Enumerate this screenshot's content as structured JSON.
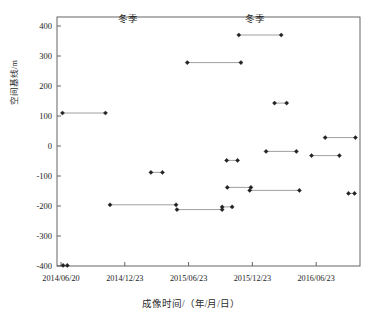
{
  "chart_data": {
    "type": "line",
    "title": "",
    "xlabel": "成像时间/（年/月/日）",
    "ylabel": "空间基线/m",
    "ylim": [
      -400,
      430
    ],
    "yticks": [
      400,
      300,
      200,
      100,
      0,
      -100,
      -200,
      -300,
      -400
    ],
    "ytick_labels": [
      "400",
      "300",
      "200",
      "100",
      "0",
      "-100",
      "-200",
      "-300",
      "-400"
    ],
    "xticks": [
      "2014/06/20",
      "2014/12/23",
      "2015/06/23",
      "2015/12/23",
      "2016/06/23"
    ],
    "xtick_labels": [
      "2014/06/20",
      "2014/12/23",
      "2015/06/23",
      "2015/12/23",
      "2016/06/23"
    ],
    "grid": false,
    "legend": null,
    "annotations": [
      {
        "text": "冬季",
        "x_frac": 0.235,
        "y_value": 412
      },
      {
        "text": "冬季",
        "x_frac": 0.655,
        "y_value": 412
      }
    ],
    "marker": "filled-diamond",
    "series": [
      {
        "name": "baseline-pair-1",
        "points": [
          {
            "x_frac": 0.018,
            "y": 110
          },
          {
            "x_frac": 0.16,
            "y": 110
          }
        ]
      },
      {
        "name": "baseline-pair-2",
        "points": [
          {
            "x_frac": 0.02,
            "y": -398
          },
          {
            "x_frac": 0.034,
            "y": -398
          }
        ]
      },
      {
        "name": "baseline-pair-3",
        "points": [
          {
            "x_frac": 0.175,
            "y": -196
          },
          {
            "x_frac": 0.393,
            "y": -196
          }
        ]
      },
      {
        "name": "baseline-pair-4",
        "points": [
          {
            "x_frac": 0.31,
            "y": -88
          },
          {
            "x_frac": 0.348,
            "y": -88
          }
        ]
      },
      {
        "name": "baseline-pair-5",
        "points": [
          {
            "x_frac": 0.396,
            "y": -212
          },
          {
            "x_frac": 0.545,
            "y": -212
          }
        ]
      },
      {
        "name": "baseline-pair-6",
        "points": [
          {
            "x_frac": 0.545,
            "y": -203
          },
          {
            "x_frac": 0.578,
            "y": -203
          }
        ]
      },
      {
        "name": "baseline-pair-7",
        "points": [
          {
            "x_frac": 0.43,
            "y": 278
          },
          {
            "x_frac": 0.607,
            "y": 278
          }
        ]
      },
      {
        "name": "baseline-pair-8",
        "points": [
          {
            "x_frac": 0.6,
            "y": 370
          },
          {
            "x_frac": 0.74,
            "y": 370
          }
        ]
      },
      {
        "name": "baseline-pair-9",
        "points": [
          {
            "x_frac": 0.56,
            "y": -48
          },
          {
            "x_frac": 0.596,
            "y": -48
          }
        ]
      },
      {
        "name": "baseline-pair-10",
        "points": [
          {
            "x_frac": 0.562,
            "y": -138
          },
          {
            "x_frac": 0.64,
            "y": -138
          }
        ]
      },
      {
        "name": "baseline-pair-11",
        "points": [
          {
            "x_frac": 0.636,
            "y": -148
          },
          {
            "x_frac": 0.8,
            "y": -148
          }
        ]
      },
      {
        "name": "baseline-pair-12",
        "points": [
          {
            "x_frac": 0.69,
            "y": -18
          },
          {
            "x_frac": 0.79,
            "y": -18
          }
        ]
      },
      {
        "name": "baseline-pair-13",
        "points": [
          {
            "x_frac": 0.718,
            "y": 143
          },
          {
            "x_frac": 0.758,
            "y": 143
          }
        ]
      },
      {
        "name": "baseline-pair-14",
        "points": [
          {
            "x_frac": 0.84,
            "y": -32
          },
          {
            "x_frac": 0.932,
            "y": -32
          }
        ]
      },
      {
        "name": "baseline-pair-15",
        "points": [
          {
            "x_frac": 0.885,
            "y": 28
          },
          {
            "x_frac": 0.985,
            "y": 28
          }
        ]
      },
      {
        "name": "baseline-pair-16",
        "points": [
          {
            "x_frac": 0.962,
            "y": -158
          },
          {
            "x_frac": 0.982,
            "y": -158
          }
        ]
      }
    ]
  },
  "axes": {
    "line_color": "#555555",
    "marker_color": "#222222",
    "segment_color": "#888888"
  }
}
